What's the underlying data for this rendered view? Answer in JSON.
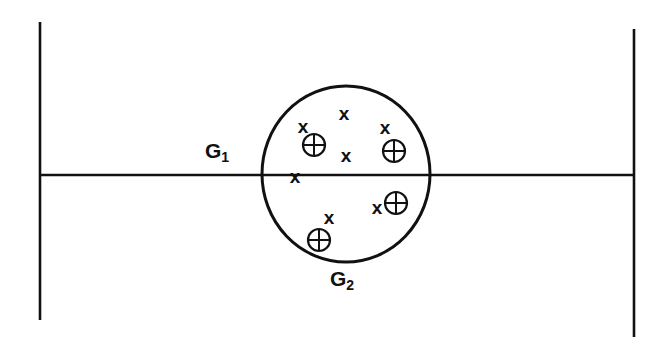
{
  "figure": {
    "type": "set-diagram",
    "title": "",
    "background_color": "#ffffff",
    "ink_color": "#111111",
    "width": 665,
    "height": 337
  },
  "labels": {
    "g1": {
      "base": "G",
      "subscript": "1",
      "full": "G₁"
    },
    "g2": {
      "base": "G",
      "subscript": "2",
      "full": "G₂"
    }
  },
  "axes": {
    "horizontal": {
      "name": "horizontal-axis",
      "y": 175,
      "x1": 40,
      "x2": 634
    },
    "vertical_left": {
      "name": "left-vertical-axis",
      "x": 40,
      "y1": 22,
      "y2": 320
    },
    "vertical_right": {
      "name": "right-vertical-axis",
      "x": 634,
      "y1": 29,
      "y2": 337
    }
  },
  "group_boundary": {
    "name": "g2-ellipse",
    "cx": 346,
    "cy": 174,
    "rx": 84,
    "ry": 88
  },
  "markers": {
    "x_points": [
      {
        "id": "x-1",
        "cx": 303,
        "cy": 126
      },
      {
        "id": "x-2",
        "cx": 344,
        "cy": 113
      },
      {
        "id": "x-3",
        "cx": 385,
        "cy": 127
      },
      {
        "id": "x-4",
        "cx": 346,
        "cy": 155
      },
      {
        "id": "x-5",
        "cx": 295,
        "cy": 176
      },
      {
        "id": "x-6",
        "cx": 377,
        "cy": 207
      },
      {
        "id": "x-7",
        "cx": 329,
        "cy": 217
      }
    ],
    "circled_cross_points": [
      {
        "id": "oplus-1",
        "cx": 314,
        "cy": 145,
        "r": 11
      },
      {
        "id": "oplus-2",
        "cx": 394,
        "cy": 151,
        "r": 11
      },
      {
        "id": "oplus-3",
        "cx": 396,
        "cy": 203,
        "r": 11
      },
      {
        "id": "oplus-4",
        "cx": 319,
        "cy": 240,
        "r": 11
      }
    ],
    "legend": {
      "x_symbol_name": "x-marker",
      "circled_cross_symbol_name": "circled-cross-marker",
      "x_glyph": "x",
      "circled_cross_glyph": "⊕"
    }
  },
  "counts": {
    "x_total": 7,
    "circled_cross_total": 4
  }
}
